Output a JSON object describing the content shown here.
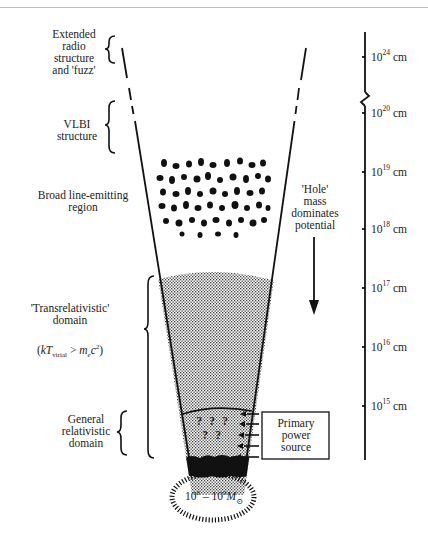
{
  "regions": {
    "extended_radio": "Extended radio structure and 'fuzz'",
    "extended_radio_lines": [
      "Extended",
      "radio",
      "structure",
      "and 'fuzz'"
    ],
    "vlbi": "VLBI structure",
    "vlbi_lines": [
      "VLBI",
      "structure"
    ],
    "blr": "Broad line-emitting region",
    "blr_lines": [
      "Broad line-emitting",
      "region"
    ],
    "transrel": "'Transrelativistic' domain",
    "transrel_lines": [
      "'Transrelativistic'",
      "domain"
    ],
    "transrel_formula": {
      "prefix": "(",
      "k": "kT",
      "sub": "virial",
      "op": " > ",
      "m": "m",
      "m_sub": "e",
      "c": "c",
      "c_sup": "2",
      "suffix": ")"
    },
    "gr": "General relativistic domain",
    "gr_lines": [
      "General",
      "relativistic",
      "domain"
    ]
  },
  "annotations": {
    "hole_mass": "'Hole' mass dominates potential",
    "hole_mass_lines": [
      "'Hole'",
      "mass",
      "dominates",
      "potential"
    ],
    "unknowns": [
      "?",
      "?",
      "?",
      "?",
      "?"
    ],
    "power_box_lines": [
      "Primary",
      "power",
      "source"
    ],
    "mass": {
      "base1": "10",
      "exp1": "8",
      "dash": " – ",
      "base2": "10",
      "exp2": "9",
      "M": "M",
      "sun": "⊙"
    }
  },
  "scale": {
    "unit": "cm",
    "ticks": [
      {
        "base": "10",
        "exp": "24",
        "unit": " cm"
      },
      {
        "base": "10",
        "exp": "20",
        "unit": " cm"
      },
      {
        "base": "10",
        "exp": "19",
        "unit": " cm"
      },
      {
        "base": "10",
        "exp": "18",
        "unit": " cm"
      },
      {
        "base": "10",
        "exp": "17",
        "unit": " cm"
      },
      {
        "base": "10",
        "exp": "16",
        "unit": " cm"
      },
      {
        "base": "10",
        "exp": "15",
        "unit": " cm"
      }
    ],
    "break_between": [
      "10^24 cm",
      "10^20 cm"
    ]
  },
  "colors": {
    "ink": "#111111",
    "stipple": "#6a6a6a",
    "background": "#ffffff",
    "rule": "#bdbdbd"
  }
}
